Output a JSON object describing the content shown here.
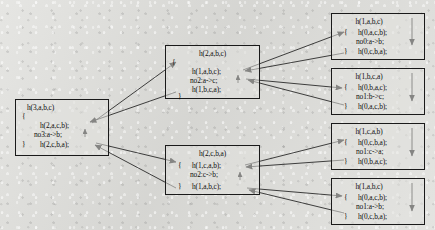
{
  "diagram": {
    "type": "call-tree",
    "background_color": "#dcdcd8",
    "box_border_color": "#1a1a1a",
    "arrow_color": "#1a1a1a",
    "nodes": [
      {
        "id": "root",
        "header": "h(3,a,b,c)",
        "open_brace": "{",
        "body_first": "h(2,a,c,b);",
        "move": "no3:a->b;",
        "close_brace": "}",
        "body_second": "h(2,c,b,a);",
        "has_move_arrow": true,
        "has_down_arrow": false
      },
      {
        "id": "mid-top",
        "header": "h(2,a,b,c)",
        "open_brace": "{",
        "body_first": "h(1,a,b,c);",
        "move": "no2:a->c;",
        "close_brace": "}",
        "body_second": "h(1,b,c,a);",
        "has_move_arrow": true,
        "has_down_arrow": false
      },
      {
        "id": "mid-bottom",
        "header": "h(2,c,b,a)",
        "open_brace": "{",
        "body_first": "h(1,c,a,b);",
        "move": "no2:c->b;",
        "close_brace": "}",
        "body_second": "h(1,a,b,c);",
        "has_move_arrow": true,
        "has_down_arrow": false
      },
      {
        "id": "leaf-1",
        "header": "h(1,a,b,c)",
        "open_brace": "{",
        "body_first": "h(0,a,c,b);",
        "move": "no0:a->b;",
        "close_brace": "}",
        "body_second": "h(0,c,b,a);",
        "has_move_arrow": false,
        "has_down_arrow": true
      },
      {
        "id": "leaf-2",
        "header": "h(1,b,c,a)",
        "open_brace": "{",
        "body_first": "h(0,b,a,c);",
        "move": "no1:b->c;",
        "close_brace": "}",
        "body_second": "h(0,a,c,b);",
        "has_move_arrow": false,
        "has_down_arrow": true
      },
      {
        "id": "leaf-3",
        "header": "h(1,c,a,b)",
        "open_brace": "{",
        "body_first": "h(0,c,b,a);",
        "move": "no1:c->a;",
        "close_brace": "}",
        "body_second": "h(0,b,a,c);",
        "has_move_arrow": false,
        "has_down_arrow": true
      },
      {
        "id": "leaf-4",
        "header": "h(1,a,b,c)",
        "open_brace": "{",
        "body_first": "h(0,a,c,b);",
        "move": "no1:a->b;",
        "close_brace": "}",
        "body_second": "h(0,c,b,a);",
        "has_move_arrow": false,
        "has_down_arrow": true
      }
    ],
    "edges": [
      {
        "from": "root",
        "to": "mid-top",
        "label": ""
      },
      {
        "from": "root",
        "to": "mid-bottom",
        "label": ""
      },
      {
        "from": "mid-top",
        "to": "leaf-1",
        "label": ""
      },
      {
        "from": "mid-top",
        "to": "leaf-2",
        "label": ""
      },
      {
        "from": "mid-bottom",
        "to": "leaf-3",
        "label": ""
      },
      {
        "from": "mid-bottom",
        "to": "leaf-4",
        "label": ""
      }
    ]
  }
}
